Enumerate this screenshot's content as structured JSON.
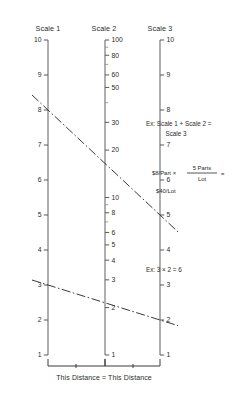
{
  "figure": {
    "type": "nomogram",
    "background": "#ffffff",
    "ink_color": "#2b2b2b",
    "axis_color": "#6e6e6e",
    "width": 232,
    "height": 393
  },
  "scales": [
    {
      "id": "scale-1",
      "header": "Scale 1",
      "kind": "linear",
      "domain": [
        1,
        10
      ],
      "label_side": "left",
      "x": 48,
      "y_top": 40,
      "y_bottom": 355,
      "labeled_ticks": [
        "10",
        "9",
        "8",
        "7",
        "6",
        "5",
        "4",
        "3",
        "2",
        "1"
      ],
      "labeled_values": [
        10,
        9,
        8,
        7,
        6,
        5,
        4,
        3,
        2,
        1
      ]
    },
    {
      "id": "scale-2",
      "header": "Scale 2",
      "kind": "logarithmic",
      "domain": [
        1,
        100
      ],
      "label_side": "right",
      "x": 105,
      "y_top": 40,
      "y_bottom": 355,
      "labeled_ticks": [
        "100",
        "80",
        "60",
        "50",
        "30",
        "20",
        "10",
        "8",
        "6",
        "5",
        "4",
        "3",
        "2",
        "1"
      ],
      "labeled_values": [
        100,
        80,
        60,
        50,
        30,
        20,
        10,
        8,
        6,
        5,
        4,
        3,
        2,
        1
      ],
      "minor_values": [
        90,
        70,
        40,
        9,
        7
      ]
    },
    {
      "id": "scale-3",
      "header": "Scale 3",
      "kind": "linear",
      "domain": [
        1,
        10
      ],
      "label_side": "right",
      "x": 160,
      "y_top": 40,
      "y_bottom": 355,
      "labeled_ticks": [
        "10",
        "9",
        "8",
        "7",
        "6",
        "5",
        "4",
        "3",
        "2",
        "1"
      ],
      "labeled_values": [
        10,
        9,
        8,
        7,
        6,
        5,
        4,
        3,
        2,
        1
      ]
    }
  ],
  "connector_lines": [
    {
      "id": "connector-upper",
      "scale1_value": 8,
      "scale2_value": 40,
      "scale3_value": 5,
      "annotation_id": "annotation-upper"
    },
    {
      "id": "connector-lower",
      "scale1_value": 3,
      "scale2_value": 6,
      "scale3_value": 2,
      "annotation_id": "annotation-lower"
    }
  ],
  "annotations": {
    "upper": {
      "line1": "Ex: Scale 1 + Scale 2 =",
      "line2": "Scale 3"
    },
    "formula": {
      "lead": "$8/Part  ×",
      "numerator": "5 Parts",
      "denominator": "Lot",
      "equals": "=",
      "result": "$40/Lot"
    },
    "lower": {
      "text": "Ex: 3 × 2 = 6"
    }
  },
  "footer": {
    "text": "This Distance = This Distance"
  }
}
